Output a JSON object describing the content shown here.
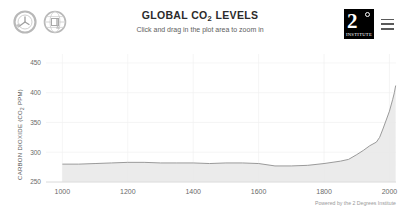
{
  "header": {
    "title": "GLOBAL CO2 LEVELS",
    "title_main": "GLOBAL CO",
    "title_sub": "2",
    "title_tail": " LEVELS",
    "subtitle": "Click and drag in the plot area to zoom in",
    "logo": {
      "numeral": "2",
      "degree_symbol": "°",
      "wordmark": "INSTITUTE"
    },
    "icons": [
      "clock-icon",
      "globe-icon",
      "hamburger-menu-icon"
    ]
  },
  "chart_data": {
    "type": "area",
    "title": "GLOBAL CO2 LEVELS",
    "subtitle": "Click and drag in the plot area to zoom in",
    "xlabel": "",
    "ylabel": "CARBON DIOXIDE (CO2 PPM)",
    "ylabel_main": "CARBON DIOXIDE (CO",
    "ylabel_sub": "2",
    "ylabel_tail": " PPM)",
    "xlim": [
      950,
      2020
    ],
    "ylim": [
      250,
      465
    ],
    "xticks": [
      1000,
      1200,
      1400,
      1600,
      1800,
      2000
    ],
    "yticks": [
      250,
      300,
      350,
      400,
      450
    ],
    "grid": true,
    "legend": null,
    "line_color": "#9a9a9a",
    "fill_color": "#e8e8e8",
    "series": [
      {
        "name": "Atmospheric CO2",
        "x": [
          1000,
          1050,
          1100,
          1150,
          1200,
          1250,
          1300,
          1350,
          1400,
          1450,
          1500,
          1550,
          1600,
          1650,
          1700,
          1750,
          1800,
          1850,
          1875,
          1900,
          1920,
          1940,
          1960,
          1970,
          1980,
          1990,
          2000,
          2010,
          2015,
          2019
        ],
        "values": [
          280,
          280,
          281,
          282,
          283,
          283,
          282,
          282,
          282,
          281,
          282,
          282,
          281,
          277,
          277,
          278,
          281,
          285,
          288,
          296,
          303,
          311,
          317,
          325,
          339,
          354,
          369,
          389,
          400,
          412
        ]
      }
    ]
  },
  "footer": {
    "credit": "Powered by the 2 Degrees Institute"
  },
  "colors": {
    "line": "#9a9a9a",
    "fill": "#e8e8e8",
    "grid": "#f1f1f1",
    "axis": "#d8d8d8",
    "text": "#6a6a6a",
    "logo_bg": "#000000"
  }
}
